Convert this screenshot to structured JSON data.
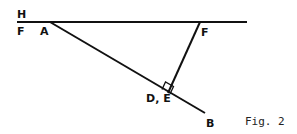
{
  "figure": {
    "caption": "Fig. 2",
    "labels": {
      "H": "H",
      "F_left": "F",
      "A": "A",
      "F_right": "F",
      "DE": "D, E",
      "B": "B"
    },
    "colors": {
      "line": "#111111",
      "background": "#ffffff"
    },
    "elements": [
      {
        "type": "line",
        "name": "horizontal line HF",
        "from": [
          17,
          22
        ],
        "to": [
          247,
          22
        ]
      },
      {
        "type": "line",
        "name": "segment AB",
        "from": [
          50,
          22
        ],
        "to": [
          205,
          113
        ]
      },
      {
        "type": "line",
        "name": "segment F to DE (perpendicular to AB)",
        "from": [
          200,
          22
        ],
        "to": [
          168,
          93
        ]
      },
      {
        "type": "right-angle-marker",
        "at": "D, E"
      }
    ]
  }
}
